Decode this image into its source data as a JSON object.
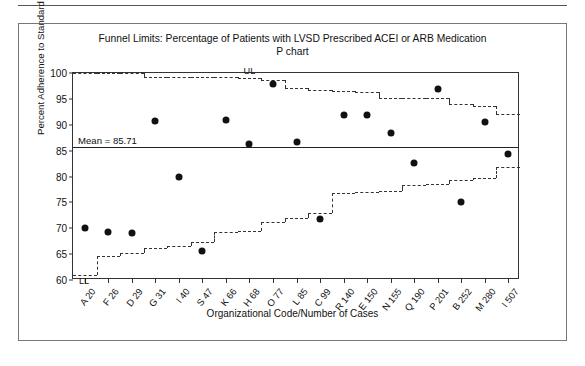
{
  "figure": {
    "title": "Funnel Limits: Percentage of Patients with LVSD Prescribed ACEI or ARB Medication",
    "subtitle": "P chart"
  },
  "chart_data": {
    "type": "scatter",
    "title": "Funnel Limits: Percentage of Patients with LVSD Prescribed ACEI or ARB Medication",
    "subtitle": "P chart",
    "xlabel": "Organizational Code/Number of Cases",
    "ylabel": "Percent Adherence to Standard",
    "ylim": [
      60,
      100
    ],
    "yticks": [
      60,
      65,
      70,
      75,
      80,
      85,
      90,
      95,
      100
    ],
    "grid": false,
    "legend": "none",
    "categories": [
      "A 20",
      "F 26",
      "D 29",
      "G 31",
      "I 40",
      "S 47",
      "K 66",
      "H 68",
      "O 77",
      "L 85",
      "C 99",
      "R 140",
      "E 150",
      "N 155",
      "Q 190",
      "P 201",
      "B 252",
      "M 280",
      "I 507"
    ],
    "cases": [
      20,
      26,
      29,
      31,
      40,
      47,
      66,
      68,
      77,
      85,
      99,
      140,
      150,
      155,
      190,
      201,
      252,
      280,
      507
    ],
    "values": [
      70.0,
      69.3,
      69.0,
      90.7,
      80.0,
      65.6,
      90.9,
      86.3,
      97.8,
      86.6,
      71.8,
      91.9,
      91.9,
      88.4,
      82.6,
      96.9,
      75.0,
      90.5,
      84.3
    ],
    "mean": 85.71,
    "mean_label": "Mean = 85.71",
    "upper_limit_label": "UL",
    "lower_limit_label": "LL",
    "upper_limits": [
      100.0,
      100.0,
      100.0,
      99.2,
      99.2,
      99.2,
      99.2,
      99.0,
      98.6,
      97.1,
      96.8,
      96.6,
      96.4,
      95.1,
      95.1,
      95.1,
      94.0,
      93.6,
      92.0
    ],
    "lower_limits": [
      61.0,
      64.7,
      65.3,
      66.2,
      66.6,
      67.4,
      69.3,
      69.5,
      71.3,
      72.0,
      73.0,
      76.8,
      77.0,
      77.2,
      78.4,
      78.6,
      79.4,
      79.8,
      81.8
    ],
    "annotations": [
      {
        "text": "UL",
        "meaning": "upper funnel control limit"
      },
      {
        "text": "LL",
        "meaning": "lower funnel control limit"
      },
      {
        "text": "Mean = 85.71",
        "meaning": "center line"
      }
    ]
  }
}
